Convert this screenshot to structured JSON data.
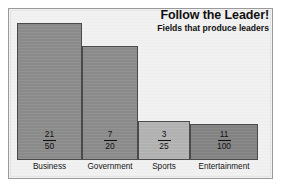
{
  "chart_data": {
    "type": "bar",
    "title": "Follow the Leader!",
    "subtitle": "Fields that produce leaders",
    "xlabel": "",
    "ylabel": "",
    "categories": [
      "Business",
      "Government",
      "Sports",
      "Entertainment"
    ],
    "values": [
      0.42,
      0.35,
      0.12,
      0.11
    ],
    "value_labels": [
      "21/50",
      "7/20",
      "3/25",
      "11/100"
    ],
    "ylim": [
      0,
      0.45
    ],
    "grid": false,
    "legend": "none",
    "bars": [
      {
        "category": "Business",
        "numerator": "21",
        "denominator": "50",
        "value": 0.42,
        "color": "#8d8d8d"
      },
      {
        "category": "Government",
        "numerator": "7",
        "denominator": "20",
        "value": 0.35,
        "color": "#8d8d8d"
      },
      {
        "category": "Sports",
        "numerator": "3",
        "denominator": "25",
        "value": 0.12,
        "color": "#b4b4b4"
      },
      {
        "category": "Entertainment",
        "numerator": "11",
        "denominator": "100",
        "value": 0.11,
        "color": "#858585"
      }
    ]
  },
  "colors": {
    "frame_border": "#9a9a9a",
    "plot_background": "#f1f1f1",
    "bar_outline": "#4a4a4a",
    "text": "#111111"
  }
}
